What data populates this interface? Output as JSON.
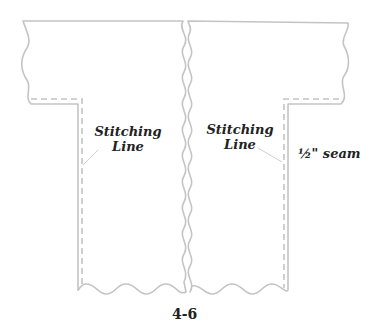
{
  "diagram": {
    "labels": {
      "left_stitching": [
        "Stitching",
        "Line"
      ],
      "right_stitching": [
        "Stitching",
        "Line"
      ],
      "seam_allowance": "½\" seam"
    },
    "figure_number": "4-6",
    "colors": {
      "outline": "#c4c4c4",
      "text": "#222222",
      "background": "#ffffff"
    }
  }
}
